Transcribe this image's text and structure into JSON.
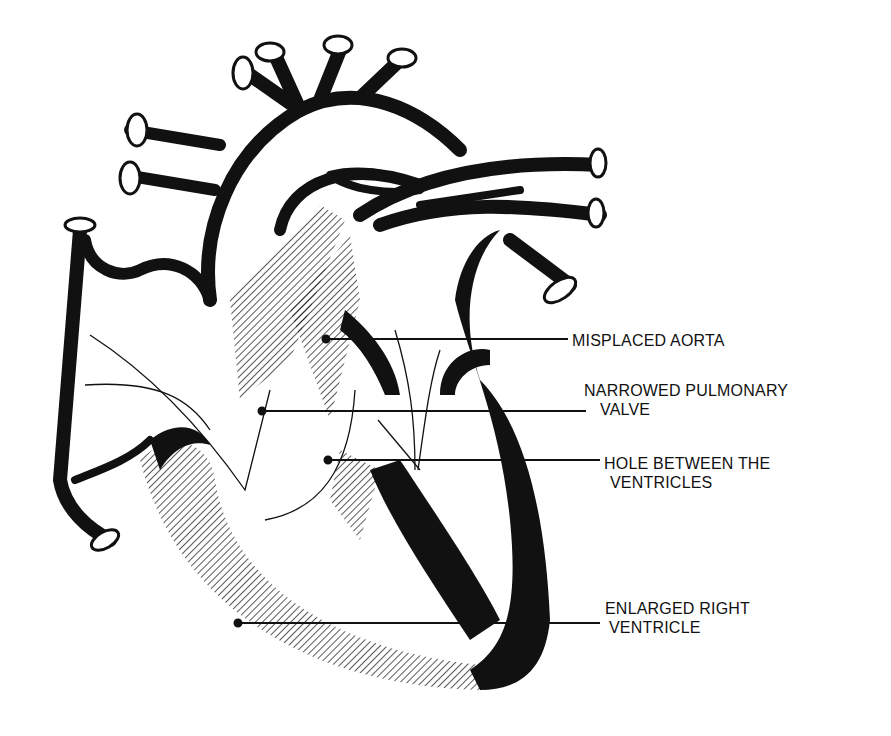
{
  "diagram": {
    "colors": {
      "ink": "#111111",
      "background": "#ffffff"
    },
    "labels": [
      {
        "id": "misplaced-aorta",
        "lines": [
          "MISPLACED AORTA"
        ]
      },
      {
        "id": "narrowed-pulmonary-valve",
        "lines": [
          "NARROWED PULMONARY",
          "VALVE"
        ]
      },
      {
        "id": "hole-between-ventricles",
        "lines": [
          "HOLE BETWEEN THE",
          "VENTRICLES"
        ]
      },
      {
        "id": "enlarged-right-ventricle",
        "lines": [
          "ENLARGED RIGHT",
          "VENTRICLE"
        ]
      }
    ]
  }
}
